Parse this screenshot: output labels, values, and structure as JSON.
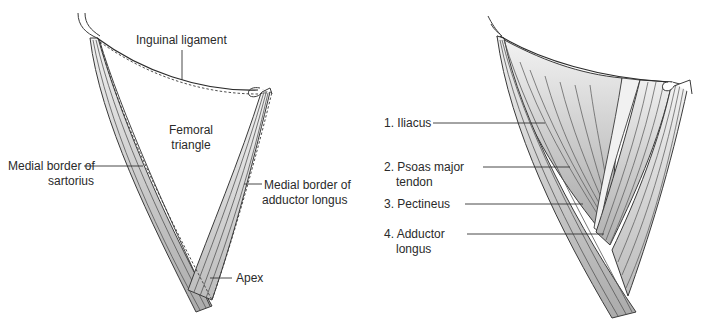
{
  "figure_left": {
    "title": "Femoral triangle boundaries",
    "labels": {
      "inguinal_ligament": "Inguinal ligament",
      "femoral_triangle_line1": "Femoral",
      "femoral_triangle_line2": "triangle",
      "sartorius_line1": "Medial border of",
      "sartorius_line2": "sartorius",
      "adductor_line1": "Medial border of",
      "adductor_line2": "adductor longus",
      "apex": "Apex"
    }
  },
  "figure_right": {
    "title": "Floor of femoral triangle",
    "labels": [
      {
        "number": "1.",
        "line1": "Iliacus",
        "line2": ""
      },
      {
        "number": "2.",
        "line1": "Psoas major",
        "line2": "tendon"
      },
      {
        "number": "3.",
        "line1": "Pectineus",
        "line2": ""
      },
      {
        "number": "4.",
        "line1": "Adductor",
        "line2": "longus"
      }
    ]
  },
  "colors": {
    "outline": "#3a3a3a",
    "muscle_light": "#e6e6e6",
    "muscle_mid": "#bdbdbd",
    "muscle_dark": "#a8a8a8",
    "text": "#2a2a2a"
  }
}
